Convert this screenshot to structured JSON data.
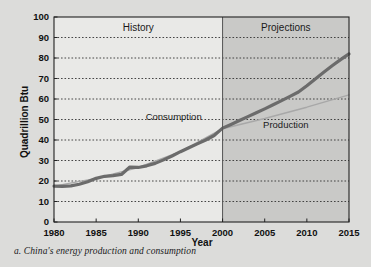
{
  "caption": "a. China's energy production and consumption",
  "chart_data": {
    "type": "line",
    "title": "",
    "xlabel": "Year",
    "ylabel": "Quadrillion Btu",
    "xlim": [
      1980,
      2015
    ],
    "ylim": [
      0,
      100
    ],
    "xticks": [
      "1980",
      "1985",
      "1990",
      "1995",
      "2000",
      "2005",
      "2010",
      "2015"
    ],
    "yticks": [
      "0",
      "10",
      "20",
      "30",
      "40",
      "50",
      "60",
      "70",
      "80",
      "90",
      "100"
    ],
    "grid": "horizontal-dotted",
    "legend": "inline-annotations",
    "divider_year": 2000,
    "regions": [
      {
        "name": "history-region",
        "label": "History",
        "from": 1980,
        "to": 2000,
        "fill": "#e9e9e7"
      },
      {
        "name": "projections-region",
        "label": "Projections",
        "from": 2000,
        "to": 2015,
        "fill": "#c9c9c7"
      }
    ],
    "annotations": [
      {
        "name": "consumption-label",
        "text": "Consumption",
        "x": 1994.2,
        "y": 50
      },
      {
        "name": "production-label",
        "text": "Production",
        "x": 2007.5,
        "y": 46
      }
    ],
    "series": [
      {
        "name": "Consumption",
        "color": "#6b6b6b",
        "width": 3.2,
        "x": [
          1980,
          1981,
          1982,
          1983,
          1984,
          1985,
          1986,
          1987,
          1988,
          1989,
          1990,
          1991,
          1992,
          1993,
          1994,
          1995,
          1996,
          1997,
          1998,
          1999,
          2000,
          2001,
          2002,
          2003,
          2004,
          2005,
          2006,
          2007,
          2008,
          2009,
          2010,
          2011,
          2012,
          2013,
          2014,
          2015
        ],
        "values": [
          17.5,
          17.4,
          17.6,
          18.4,
          19.6,
          21.3,
          22.3,
          22.6,
          23.2,
          26.8,
          26.6,
          27.4,
          28.6,
          30.3,
          32.2,
          34.3,
          36.2,
          38.1,
          40.0,
          42.2,
          45.8,
          47.6,
          49.5,
          51.4,
          53.3,
          55.2,
          57.2,
          59.2,
          61.3,
          63.4,
          66.5,
          69.8,
          73.0,
          76.2,
          79.2,
          82.0
        ]
      },
      {
        "name": "Production",
        "color": "#a8a8a8",
        "width": 1.4,
        "x": [
          1980,
          1985,
          1990,
          1995,
          2000,
          2005,
          2010,
          2015
        ],
        "values": [
          17.5,
          21.3,
          26.6,
          34.3,
          45.5,
          50.5,
          56.0,
          62.0
        ]
      }
    ]
  }
}
